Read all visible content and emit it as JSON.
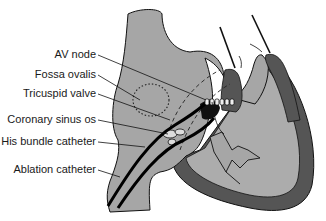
{
  "diagram": {
    "colors": {
      "background": "#ffffff",
      "atrium_fill": "#a6a6a6",
      "ventricle_wall": "#555555",
      "ventricle_fill": "#acacac",
      "outline": "#111111",
      "catheter": "#000000"
    },
    "labels": [
      {
        "id": "av-node",
        "text": "AV node"
      },
      {
        "id": "fossa-ovalis",
        "text": "Fossa ovalis"
      },
      {
        "id": "tricuspid-valve",
        "text": "Tricuspid valve"
      },
      {
        "id": "coronary-sinus-os",
        "text": "Coronary sinus os"
      },
      {
        "id": "his-bundle-catheter",
        "text": "His bundle catheter"
      },
      {
        "id": "ablation-catheter",
        "text": "Ablation catheter"
      }
    ]
  }
}
